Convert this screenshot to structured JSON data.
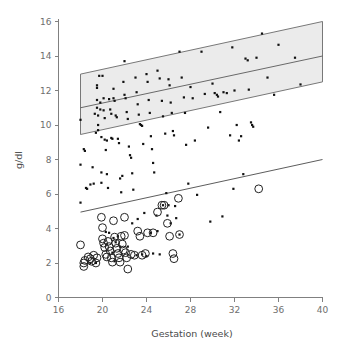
{
  "chart_data": {
    "type": "scatter",
    "title": "",
    "xlabel": "Gestation (week)",
    "ylabel": "g/dl",
    "xlim": [
      16,
      40
    ],
    "ylim": [
      0,
      16
    ],
    "xticks": [
      16,
      20,
      24,
      28,
      32,
      36,
      40
    ],
    "yticks": [
      0,
      2,
      4,
      6,
      8,
      10,
      12,
      14,
      16
    ],
    "grid": false,
    "legend": null,
    "annotations": [
      {
        "name": "reference-band",
        "description": "Shaded normal-range parallelogram with central regression line",
        "x_range": [
          18,
          40
        ],
        "upper_at_x_start": 12.95,
        "upper_at_x_end": 16.0,
        "lower_at_x_start": 9.45,
        "lower_at_x_end": 12.5,
        "mid_at_x_start": 11.0,
        "mid_at_x_end": 14.0,
        "fill_color": "#ebebeb",
        "border_color": "#6a6a6a"
      },
      {
        "name": "lower-trend-line",
        "description": "Lower regression line through sparse low values",
        "x_range": [
          18,
          40
        ],
        "y_at_x_start": 4.95,
        "y_at_x_end": 8.0,
        "color": "#4a4a4a"
      }
    ],
    "series": [
      {
        "name": "haemoglobin-dots",
        "marker": "filled-dot",
        "color": "#111111",
        "points": [
          [
            18.0,
            10.3
          ],
          [
            18.0,
            7.7
          ],
          [
            18.0,
            5.5
          ],
          [
            18.3,
            8.6
          ],
          [
            18.4,
            8.5
          ],
          [
            18.5,
            6.35
          ],
          [
            18.6,
            6.3
          ],
          [
            18.9,
            6.55
          ],
          [
            19.1,
            7.55
          ],
          [
            19.2,
            6.6
          ],
          [
            19.3,
            10.65
          ],
          [
            19.4,
            9.55
          ],
          [
            19.5,
            12.3
          ],
          [
            19.5,
            12.15
          ],
          [
            19.5,
            11.45
          ],
          [
            19.5,
            11.0
          ],
          [
            19.6,
            10.55
          ],
          [
            19.6,
            10.0
          ],
          [
            19.6,
            9.7
          ],
          [
            19.7,
            12.85
          ],
          [
            19.8,
            11.3
          ],
          [
            19.8,
            10.9
          ],
          [
            19.9,
            9.3
          ],
          [
            19.9,
            7.25
          ],
          [
            19.9,
            6.65
          ],
          [
            20.0,
            12.85
          ],
          [
            20.1,
            11.55
          ],
          [
            20.1,
            10.85
          ],
          [
            20.2,
            10.4
          ],
          [
            20.2,
            9.15
          ],
          [
            20.3,
            8.55
          ],
          [
            20.4,
            9.1
          ],
          [
            20.4,
            7.15
          ],
          [
            20.5,
            6.35
          ],
          [
            20.6,
            11.5
          ],
          [
            20.7,
            10.9
          ],
          [
            20.8,
            10.65
          ],
          [
            20.8,
            9.25
          ],
          [
            20.9,
            9.2
          ],
          [
            21.0,
            12.1
          ],
          [
            21.0,
            11.55
          ],
          [
            21.1,
            11.4
          ],
          [
            21.2,
            10.55
          ],
          [
            21.3,
            10.45
          ],
          [
            21.4,
            9.2
          ],
          [
            21.5,
            8.95
          ],
          [
            21.6,
            6.9
          ],
          [
            21.7,
            6.1
          ],
          [
            21.8,
            7.05
          ],
          [
            21.9,
            12.5
          ],
          [
            22.0,
            13.7
          ],
          [
            22.0,
            11.75
          ],
          [
            22.1,
            11.55
          ],
          [
            22.2,
            10.75
          ],
          [
            22.3,
            10.35
          ],
          [
            22.4,
            8.75
          ],
          [
            22.5,
            8.25
          ],
          [
            22.6,
            8.1
          ],
          [
            22.7,
            7.2
          ],
          [
            22.8,
            6.25
          ],
          [
            23.0,
            12.75
          ],
          [
            23.1,
            11.9
          ],
          [
            23.2,
            11.2
          ],
          [
            23.3,
            10.6
          ],
          [
            23.4,
            10.05
          ],
          [
            23.5,
            10.0
          ],
          [
            23.6,
            9.95
          ],
          [
            23.7,
            8.9
          ],
          [
            23.8,
            4.9
          ],
          [
            24.0,
            12.95
          ],
          [
            24.1,
            12.5
          ],
          [
            24.2,
            11.45
          ],
          [
            24.3,
            10.7
          ],
          [
            24.4,
            9.35
          ],
          [
            24.5,
            8.6
          ],
          [
            24.6,
            7.8
          ],
          [
            24.7,
            7.25
          ],
          [
            24.9,
            4.75
          ],
          [
            25.0,
            13.15
          ],
          [
            25.2,
            12.7
          ],
          [
            25.4,
            11.4
          ],
          [
            25.5,
            10.5
          ],
          [
            25.7,
            9.5
          ],
          [
            25.8,
            6.05
          ],
          [
            25.9,
            4.75
          ],
          [
            26.0,
            12.65
          ],
          [
            26.1,
            12.3
          ],
          [
            26.2,
            11.3
          ],
          [
            26.3,
            10.7
          ],
          [
            26.4,
            9.65
          ],
          [
            26.5,
            9.4
          ],
          [
            26.6,
            5.3
          ],
          [
            26.7,
            4.6
          ],
          [
            27.0,
            14.25
          ],
          [
            27.2,
            12.75
          ],
          [
            27.4,
            11.6
          ],
          [
            27.5,
            10.7
          ],
          [
            27.6,
            8.85
          ],
          [
            27.8,
            6.6
          ],
          [
            28.0,
            12.2
          ],
          [
            28.2,
            11.55
          ],
          [
            28.4,
            9.1
          ],
          [
            28.6,
            5.95
          ],
          [
            29.0,
            14.25
          ],
          [
            29.3,
            11.8
          ],
          [
            29.6,
            9.85
          ],
          [
            29.8,
            4.4
          ],
          [
            30.0,
            12.4
          ],
          [
            30.2,
            11.85
          ],
          [
            30.4,
            11.75
          ],
          [
            30.5,
            11.65
          ],
          [
            30.7,
            10.75
          ],
          [
            30.9,
            4.7
          ],
          [
            31.0,
            11.9
          ],
          [
            31.3,
            11.85
          ],
          [
            31.6,
            9.4
          ],
          [
            31.8,
            14.5
          ],
          [
            31.9,
            6.3
          ],
          [
            32.0,
            12.0
          ],
          [
            32.2,
            10.0
          ],
          [
            32.4,
            9.1
          ],
          [
            32.6,
            9.35
          ],
          [
            32.8,
            7.15
          ],
          [
            33.0,
            13.85
          ],
          [
            33.2,
            13.75
          ],
          [
            33.3,
            12.05
          ],
          [
            33.5,
            10.15
          ],
          [
            33.6,
            10.0
          ],
          [
            33.7,
            9.9
          ],
          [
            34.0,
            13.9
          ],
          [
            34.5,
            15.3
          ],
          [
            35.0,
            12.75
          ],
          [
            35.6,
            11.75
          ],
          [
            36.0,
            14.65
          ],
          [
            37.5,
            13.9
          ],
          [
            38.0,
            12.35
          ],
          [
            20.3,
            3.8
          ],
          [
            20.6,
            3.75
          ],
          [
            21.0,
            3.45
          ],
          [
            21.2,
            3.2
          ],
          [
            21.4,
            3.55
          ],
          [
            21.6,
            2.95
          ],
          [
            22.3,
            2.95
          ],
          [
            20.9,
            2.6
          ],
          [
            21.1,
            2.1
          ],
          [
            23.1,
            2.45
          ],
          [
            23.6,
            2.5
          ],
          [
            24.0,
            2.4
          ],
          [
            24.6,
            2.55
          ],
          [
            25.2,
            2.5
          ],
          [
            22.7,
            4.3
          ],
          [
            23.2,
            4.55
          ],
          [
            25.5,
            5.35
          ],
          [
            26.0,
            5.35
          ],
          [
            27.0,
            3.65
          ],
          [
            24.4,
            3.75
          ],
          [
            25.0,
            3.85
          ],
          [
            26.2,
            4.3
          ],
          [
            19.4,
            2.0
          ],
          [
            18.9,
            2.0
          ]
        ]
      },
      {
        "name": "thalassaemia-open-circles",
        "marker": "open-circle",
        "color": "#222222",
        "points": [
          [
            18.0,
            3.05
          ],
          [
            18.3,
            2.0
          ],
          [
            18.3,
            1.8
          ],
          [
            18.4,
            2.15
          ],
          [
            18.7,
            2.35
          ],
          [
            18.9,
            2.25
          ],
          [
            19.0,
            2.1
          ],
          [
            19.2,
            2.45
          ],
          [
            19.4,
            2.0
          ],
          [
            19.5,
            2.3
          ],
          [
            19.9,
            4.65
          ],
          [
            20.0,
            4.05
          ],
          [
            20.0,
            3.4
          ],
          [
            20.1,
            3.15
          ],
          [
            20.2,
            2.9
          ],
          [
            20.3,
            2.5
          ],
          [
            20.4,
            2.35
          ],
          [
            20.5,
            3.25
          ],
          [
            20.6,
            2.95
          ],
          [
            20.7,
            2.7
          ],
          [
            20.8,
            2.3
          ],
          [
            20.9,
            2.05
          ],
          [
            21.0,
            4.45
          ],
          [
            21.1,
            3.5
          ],
          [
            21.2,
            3.15
          ],
          [
            21.3,
            2.85
          ],
          [
            21.4,
            2.55
          ],
          [
            21.5,
            2.3
          ],
          [
            21.6,
            2.05
          ],
          [
            21.7,
            3.55
          ],
          [
            21.8,
            3.1
          ],
          [
            21.9,
            2.75
          ],
          [
            22.0,
            4.65
          ],
          [
            22.0,
            3.6
          ],
          [
            22.1,
            2.6
          ],
          [
            22.2,
            2.3
          ],
          [
            22.3,
            1.65
          ],
          [
            22.6,
            2.5
          ],
          [
            22.9,
            2.45
          ],
          [
            23.2,
            3.85
          ],
          [
            23.4,
            3.55
          ],
          [
            23.6,
            2.45
          ],
          [
            23.9,
            2.55
          ],
          [
            24.1,
            3.75
          ],
          [
            24.6,
            3.75
          ],
          [
            25.0,
            4.95
          ],
          [
            25.4,
            5.35
          ],
          [
            25.6,
            5.35
          ],
          [
            25.9,
            4.3
          ],
          [
            26.1,
            3.55
          ],
          [
            26.4,
            2.55
          ],
          [
            26.5,
            2.25
          ],
          [
            26.9,
            5.75
          ],
          [
            27.0,
            3.65
          ],
          [
            34.2,
            6.3
          ]
        ]
      }
    ]
  },
  "axes": {
    "y_title": "g/dl",
    "x_title": "Gestation (week)",
    "x_tick_labels": [
      "16",
      "20",
      "24",
      "28",
      "32",
      "36",
      "40"
    ],
    "y_tick_labels": [
      "0",
      "2",
      "4",
      "6",
      "8",
      "10",
      "12",
      "14",
      "16"
    ]
  }
}
